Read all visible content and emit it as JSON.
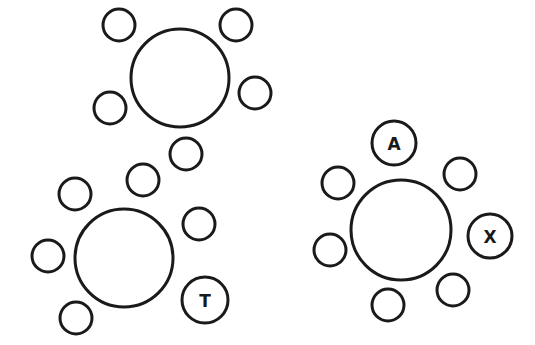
{
  "tables": [
    {
      "name": "table-top",
      "cx": 180,
      "cy": 78,
      "r": 49,
      "seats": [
        {
          "cx": 119,
          "cy": 25,
          "r": 16,
          "label": ""
        },
        {
          "cx": 236,
          "cy": 25,
          "r": 16,
          "label": ""
        },
        {
          "cx": 110,
          "cy": 108,
          "r": 16,
          "label": ""
        },
        {
          "cx": 255,
          "cy": 93,
          "r": 16,
          "label": ""
        },
        {
          "cx": 186,
          "cy": 154,
          "r": 16,
          "label": ""
        }
      ]
    },
    {
      "name": "table-bottom-left",
      "cx": 124,
      "cy": 258,
      "r": 49,
      "seats": [
        {
          "cx": 75,
          "cy": 194,
          "r": 16,
          "label": ""
        },
        {
          "cx": 143,
          "cy": 180,
          "r": 16,
          "label": ""
        },
        {
          "cx": 199,
          "cy": 224,
          "r": 16,
          "label": ""
        },
        {
          "cx": 48,
          "cy": 256,
          "r": 16,
          "label": ""
        },
        {
          "cx": 76,
          "cy": 318,
          "r": 16,
          "label": ""
        },
        {
          "cx": 205,
          "cy": 300,
          "r": 23,
          "label": "T"
        }
      ]
    },
    {
      "name": "table-right",
      "cx": 401,
      "cy": 230,
      "r": 50,
      "seats": [
        {
          "cx": 394,
          "cy": 143,
          "r": 22,
          "label": "A"
        },
        {
          "cx": 460,
          "cy": 174,
          "r": 16,
          "label": ""
        },
        {
          "cx": 338,
          "cy": 183,
          "r": 16,
          "label": ""
        },
        {
          "cx": 490,
          "cy": 236,
          "r": 22,
          "label": "X"
        },
        {
          "cx": 330,
          "cy": 250,
          "r": 16,
          "label": ""
        },
        {
          "cx": 453,
          "cy": 290,
          "r": 16,
          "label": ""
        },
        {
          "cx": 388,
          "cy": 305,
          "r": 16,
          "label": ""
        }
      ]
    }
  ]
}
